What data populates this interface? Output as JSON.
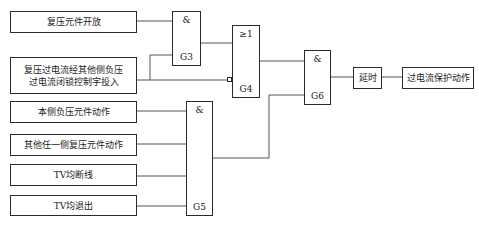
{
  "diagram": {
    "inputs": [
      {
        "id": "in1",
        "label": "复压元件开放"
      },
      {
        "id": "in2",
        "label_line1": "复压过电流经其他侧负压",
        "label_line2": "过电流闭锁控制字投入"
      },
      {
        "id": "in3",
        "label": "本侧负压元件动作"
      },
      {
        "id": "in4",
        "label": "其他任一侧复压元件动作"
      },
      {
        "id": "in5",
        "label": "TV均断线"
      },
      {
        "id": "in6",
        "label": "TV均退出"
      }
    ],
    "gates": {
      "g3": {
        "symbol": "&",
        "name": "G3"
      },
      "g4": {
        "symbol": "≥1",
        "name": "G4"
      },
      "g5": {
        "symbol": "&",
        "name": "G5"
      },
      "g6": {
        "symbol": "&",
        "name": "G6"
      }
    },
    "delay": {
      "label": "延时"
    },
    "output": {
      "label": "过电流保护动作"
    },
    "colors": {
      "line": "#2a2a2a",
      "background": "#ffffff"
    }
  }
}
